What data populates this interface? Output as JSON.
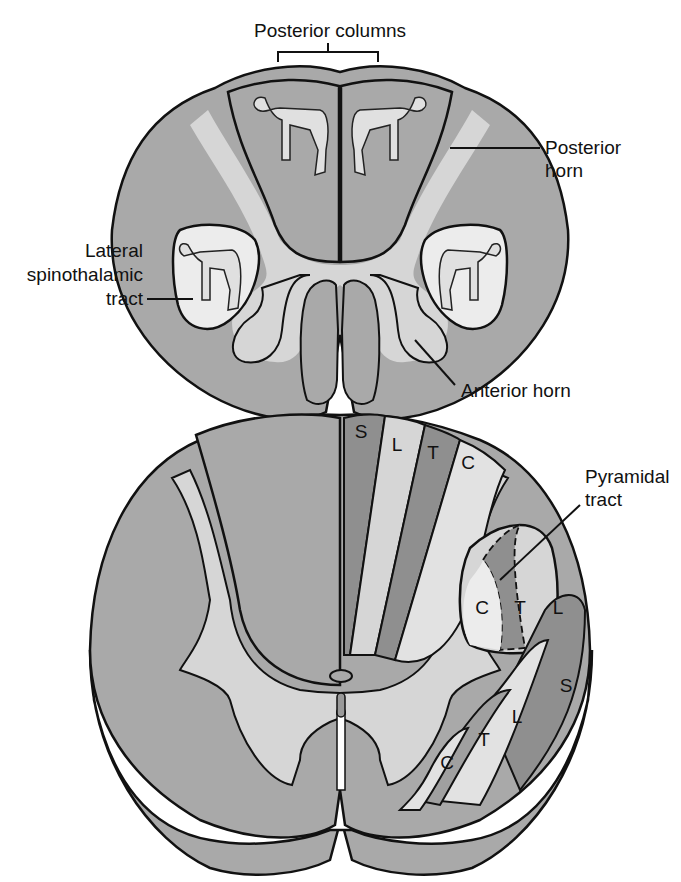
{
  "figure": {
    "top_section": {
      "labels": {
        "posterior_columns": "Posterior columns",
        "posterior_horn_1": "Posterior",
        "posterior_horn_2": "horn",
        "lateral_spinothalamic_1": "Lateral",
        "lateral_spinothalamic_2": "spinothalamic",
        "lateral_spinothalamic_3": "tract",
        "anterior_horn": "Anterior horn"
      }
    },
    "bottom_section": {
      "labels": {
        "pyramidal_tract_1": "Pyramidal",
        "pyramidal_tract_2": "tract"
      },
      "posterior_column_segments": [
        "S",
        "L",
        "T",
        "C"
      ],
      "lateral_pyramidal_segments": [
        "C",
        "T",
        "L"
      ],
      "anterior_lateral_segments": [
        "C",
        "T",
        "L",
        "S"
      ]
    },
    "colors": {
      "white_matter": "#a9a9a9",
      "gray_matter": "#d6d6d6",
      "dark_segment": "#8f8f8f",
      "light_segment": "#e2e2e2",
      "outline": "#111111"
    }
  }
}
